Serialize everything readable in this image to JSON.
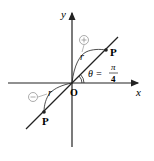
{
  "diagram": {
    "type": "polar-coordinates-line",
    "axes": {
      "x_label": "x",
      "y_label": "y",
      "origin_label": "O"
    },
    "line": {
      "description": "line through origin at angle theta",
      "angle_label": "θ =",
      "angle_num": "π",
      "angle_den": "4"
    },
    "points": [
      {
        "label": "P",
        "position": "upper-right",
        "sign": "+"
      },
      {
        "label": "P",
        "position": "lower-left",
        "sign": "−"
      }
    ],
    "radius_label": "r",
    "colors": {
      "stroke": "#222222",
      "circle_stroke": "#888888"
    }
  }
}
